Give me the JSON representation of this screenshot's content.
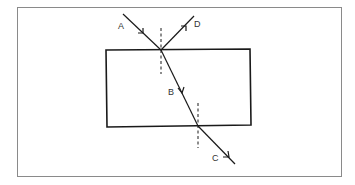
{
  "figure": {
    "colors": {
      "background": "#ffffff",
      "frame": "#8a8a8a",
      "block": "#1a1a1a",
      "ray": "#1a1a1a",
      "normal": "#1a1a1a",
      "label": "#333333"
    }
  },
  "labels": {
    "A": "A",
    "B": "B",
    "C": "C",
    "D": "D"
  },
  "rays": [
    {
      "id": "A",
      "role": "incident ray",
      "from": [
        123,
        14
      ],
      "to": [
        161,
        50
      ]
    },
    {
      "id": "D",
      "role": "reflected ray",
      "from": [
        161,
        50
      ],
      "to": [
        194,
        16
      ]
    },
    {
      "id": "B",
      "role": "refracted ray inside block",
      "from": [
        161,
        50
      ],
      "to": [
        198,
        126
      ]
    },
    {
      "id": "C",
      "role": "emergent ray",
      "from": [
        198,
        126
      ],
      "to": [
        235,
        164
      ]
    }
  ],
  "normals": [
    {
      "x": 161,
      "y1": 28,
      "y2": 74
    },
    {
      "x": 198,
      "y1": 103,
      "y2": 148
    }
  ],
  "block": {
    "x": 106,
    "y": 49,
    "width": 145,
    "height": 77
  }
}
